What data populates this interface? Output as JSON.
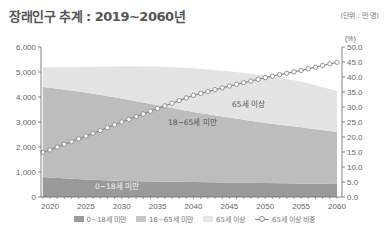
{
  "header": {
    "title": "장래인구 추계 : 2019~2060년",
    "unit": "(단위 : 만 명)"
  },
  "chart_data": {
    "type": "area",
    "title": "장래인구 추계 : 2019~2060년",
    "unit": "(단위 : 만 명)",
    "x": [
      2019,
      2020,
      2025,
      2030,
      2035,
      2040,
      2045,
      2050,
      2055,
      2060
    ],
    "x_ticks": [
      "2020",
      "2025",
      "2030",
      "2035",
      "2040",
      "2045",
      "2050",
      "2055",
      "2060"
    ],
    "y_left": {
      "label": "",
      "range": [
        0,
        6000
      ],
      "ticks": [
        "0",
        "1,000",
        "2,000",
        "3,000",
        "4,000",
        "5,000",
        "6,000"
      ]
    },
    "y_right": {
      "label": "(%)",
      "range": [
        0,
        50
      ],
      "ticks": [
        "0.0",
        "5.0",
        "10.0",
        "15.0",
        "20.0",
        "25.0",
        "30.0",
        "35.0",
        "40.0",
        "45.0",
        "50.0"
      ]
    },
    "series": [
      {
        "name": "0~18세 미만",
        "type": "stacked-area",
        "axis": "left",
        "color": "#9a9a9a",
        "values": [
          800,
          780,
          700,
          640,
          620,
          600,
          580,
          560,
          540,
          520
        ]
      },
      {
        "name": "18~65세 미만",
        "type": "stacked-area",
        "axis": "left",
        "color": "#bdbdbd",
        "values": [
          3600,
          3590,
          3480,
          3300,
          3050,
          2800,
          2600,
          2400,
          2250,
          2080
        ]
      },
      {
        "name": "65세 이상",
        "type": "stacked-area",
        "axis": "left",
        "color": "#e4e4e4",
        "values": [
          780,
          820,
          1020,
          1290,
          1550,
          1750,
          1850,
          1900,
          1830,
          1640
        ]
      },
      {
        "name": "65세 이상 비중",
        "type": "line",
        "axis": "right",
        "color": "#8a8a8a",
        "marker": "circle",
        "values": [
          14.9,
          15.7,
          20.3,
          25.0,
          29.5,
          33.9,
          37.0,
          39.8,
          42.2,
          44.9
        ]
      }
    ],
    "annotations": [
      "0~18세 미만",
      "18~65세 미만",
      "65세 이상"
    ],
    "legend_position": "bottom",
    "grid": false
  },
  "legend": [
    {
      "label": "0~18세 미만",
      "color": "#9a9a9a",
      "kind": "swatch"
    },
    {
      "label": "18~65세 미만",
      "color": "#c8c8c8",
      "kind": "swatch"
    },
    {
      "label": "65세 이상",
      "color": "#e8e8e8",
      "kind": "swatch"
    },
    {
      "label": "65세 이상 비중",
      "color": "#8a8a8a",
      "kind": "line"
    }
  ],
  "annotation_labels": {
    "youth": "0~18세 미만",
    "working": "18~65세 미만",
    "elderly": "65세 이상"
  }
}
